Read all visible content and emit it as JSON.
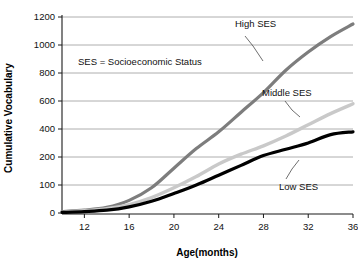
{
  "chart_data": {
    "type": "line",
    "title": "",
    "xlabel": "Age(months)",
    "ylabel": "Cumulative Vocabulary",
    "annotation": "SES = Socioeconomic Status",
    "grid": true,
    "legend_position": "inline-labels",
    "xlim": [
      10,
      36
    ],
    "ylim": [
      0,
      1200
    ],
    "x_ticks": [
      12,
      16,
      20,
      24,
      28,
      32,
      36
    ],
    "x_tick_labels": [
      "12",
      "16",
      "20",
      "24",
      "28",
      "32",
      "36"
    ],
    "y_ticks": [
      0,
      100,
      200,
      400,
      600,
      800,
      1000,
      1200
    ],
    "y_tick_labels": [
      "0",
      "100",
      "200",
      "400",
      "600",
      "800",
      "1000",
      "1200"
    ],
    "y_axis_note": "Non-linear y axis: 0-100 and 100-200 each occupy one band, then 200-unit bands",
    "x": [
      10,
      12,
      14,
      16,
      18,
      20,
      22,
      24,
      26,
      28,
      30,
      32,
      34,
      36
    ],
    "series": [
      {
        "name": "High SES",
        "color": "#7d7d7d",
        "values": [
          5,
          10,
          20,
          45,
          90,
          160,
          260,
          380,
          520,
          660,
          820,
          950,
          1060,
          1150
        ]
      },
      {
        "name": "Middle SES",
        "color": "#c9c9c9",
        "values": [
          3,
          8,
          15,
          30,
          55,
          90,
          130,
          175,
          220,
          280,
          350,
          430,
          510,
          580
        ]
      },
      {
        "name": "Low SES",
        "color": "#000000",
        "values": [
          2,
          5,
          10,
          22,
          42,
          70,
          100,
          135,
          170,
          210,
          255,
          300,
          360,
          380
        ]
      }
    ]
  },
  "labels": {
    "high_ses": "High SES",
    "middle_ses": "Middle SES",
    "low_ses": "Low SES",
    "note": "SES = Socioeconomic Status",
    "x_axis_title": "Age(months)",
    "y_axis_title": "Cumulative Vocabulary"
  }
}
